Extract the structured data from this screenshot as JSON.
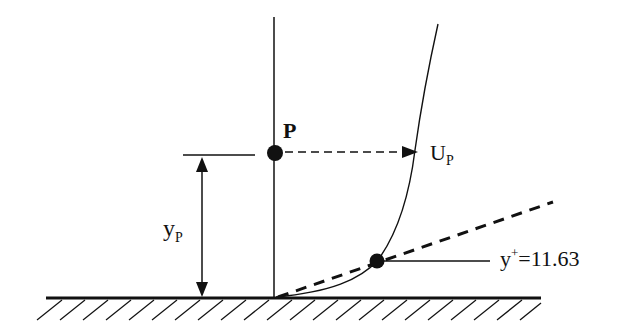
{
  "diagram": {
    "title": "",
    "labels": {
      "point": "P",
      "velocity_main": "U",
      "velocity_sub": "P",
      "distance_main": "y",
      "distance_sub": "P",
      "yplus_main": "y",
      "yplus_sup": "+",
      "yplus_value": "=11.63"
    },
    "colors": {
      "stroke": "#111111",
      "background": "#ffffff"
    },
    "elements": {
      "wall": "hatched solid wall",
      "velocity_profile": "curved velocity profile",
      "linear_sublayer": "dashed linear sublayer line",
      "arrow_to_profile": "dashed arrow from P to U_P"
    }
  }
}
